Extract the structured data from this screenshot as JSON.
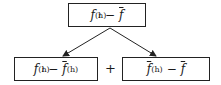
{
  "nodes": {
    "top": {
      "f": "f",
      "sup": "(h)",
      "sub": "i",
      "minus": "−",
      "fbar": "f"
    },
    "bottom_left": {
      "f": "f",
      "sup": "(h)",
      "sub": "i",
      "minus": "−",
      "fbar": "f",
      "fbar_sup": "(h)"
    },
    "bottom_right": {
      "fbar": "f",
      "fbar_sup": "(h)",
      "minus": "−",
      "fbar2": "f"
    }
  },
  "operator": "+",
  "edges": [
    {
      "from": "top",
      "to": "bottom_left"
    },
    {
      "from": "top",
      "to": "bottom_right"
    }
  ]
}
